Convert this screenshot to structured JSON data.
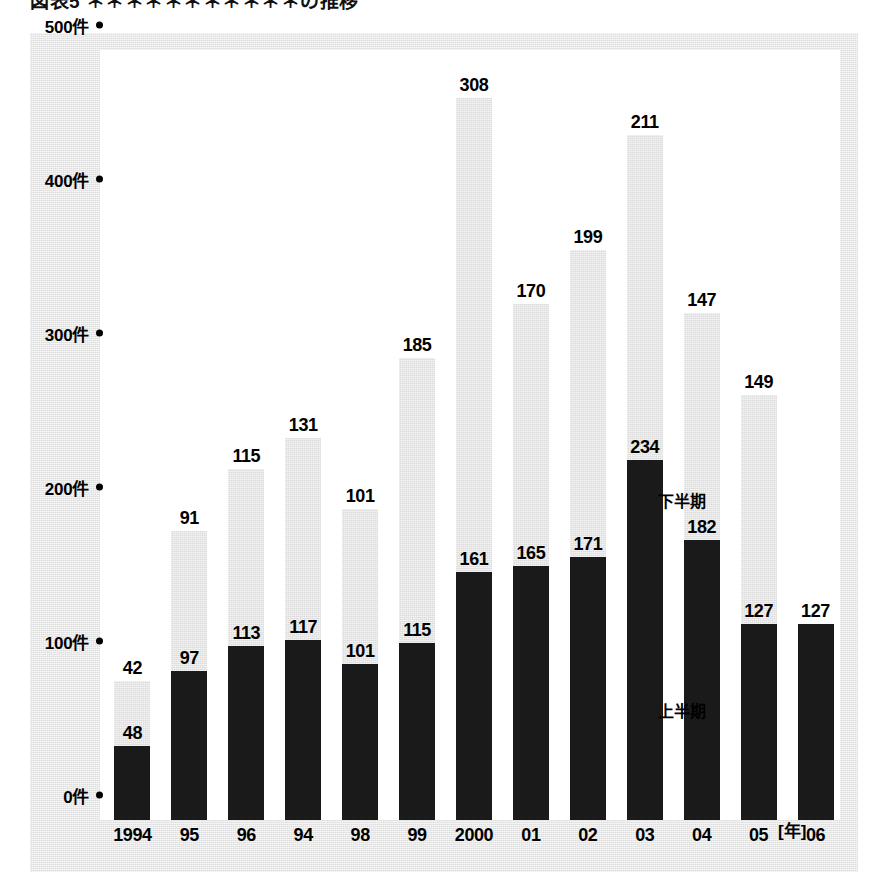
{
  "figure": {
    "title": "図表5 ＊＊＊＊＊＊＊＊＊＊＊の推移",
    "y_axis_unit": "件",
    "x_axis_unit": "[年]"
  },
  "legend": {
    "upper_label": "下半期",
    "lower_label": "上半期"
  },
  "chart_data": {
    "type": "bar",
    "title": "図表5 ＊＊＊＊＊＊＊＊＊＊＊の推移",
    "stacked": true,
    "xlabel": "[年]",
    "ylabel": "件",
    "ylim": [
      0,
      500
    ],
    "yticks": [
      0,
      100,
      200,
      300,
      400,
      500
    ],
    "ytick_labels": [
      "0件",
      "100件",
      "200件",
      "300件",
      "400件",
      "500件"
    ],
    "grid": false,
    "legend_position": "inside-right",
    "categories": [
      "1994",
      "95",
      "96",
      "94",
      "98",
      "99",
      "2000",
      "01",
      "02",
      "03",
      "04",
      "05",
      "06"
    ],
    "series": [
      {
        "name": "上半期",
        "color": "#1a1a1a",
        "values": [
          48,
          97,
          113,
          117,
          101,
          115,
          161,
          165,
          171,
          234,
          182,
          127,
          127
        ]
      },
      {
        "name": "下半期",
        "color": "#dcdcdc",
        "values": [
          42,
          91,
          115,
          131,
          101,
          185,
          308,
          170,
          199,
          211,
          147,
          149,
          null
        ]
      }
    ],
    "totals": [
      90,
      188,
      228,
      248,
      202,
      300,
      469,
      335,
      370,
      445,
      329,
      276,
      127
    ]
  }
}
